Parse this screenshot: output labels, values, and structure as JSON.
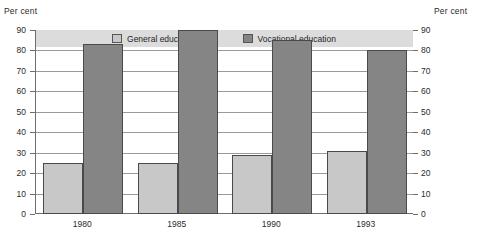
{
  "axis_titles": {
    "left": "Per cent",
    "right": "Per cent"
  },
  "legend": {
    "items": [
      {
        "label": "General education",
        "color": "#c8c8c8"
      },
      {
        "label": "Vocational education",
        "color": "#858585"
      }
    ]
  },
  "yticks": [
    "90",
    "80",
    "70",
    "60",
    "50",
    "40",
    "30",
    "20",
    "10",
    "0"
  ],
  "chart_data": {
    "type": "bar",
    "title": "",
    "subtitle": "",
    "xlabel": "",
    "ylabel": "Per cent",
    "ylim": [
      0,
      90
    ],
    "ytick_step": 10,
    "grid": true,
    "legend_position": "top-inside",
    "categories": [
      "1980",
      "1985",
      "1990",
      "1993"
    ],
    "series": [
      {
        "name": "General education",
        "color": "#c8c8c8",
        "values": [
          25,
          25,
          29,
          31
        ]
      },
      {
        "name": "Vocational education",
        "color": "#858585",
        "values": [
          83,
          90,
          85,
          80
        ]
      }
    ]
  }
}
